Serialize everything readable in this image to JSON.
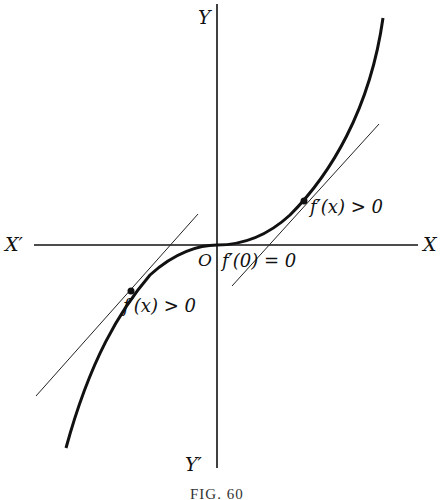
{
  "figure": {
    "caption": "FIG. 60",
    "axes": {
      "x_positive_label": "X",
      "x_negative_label": "X′",
      "y_positive_label": "Y",
      "y_negative_label": "Y′",
      "origin_label": "O"
    },
    "annotations": {
      "right_point": "f′(x) > 0",
      "origin_point": "f′(0) = 0",
      "left_point": "f′(x) > 0"
    },
    "curve": "cubic-like increasing curve with horizontal tangent at origin (inflection point)",
    "tangent_lines": [
      {
        "at": "right point",
        "slope": "positive"
      },
      {
        "at": "origin",
        "slope": "zero"
      },
      {
        "at": "left point",
        "slope": "positive"
      }
    ],
    "colors": {
      "ink": "#111111",
      "background": "#ffffff"
    }
  }
}
